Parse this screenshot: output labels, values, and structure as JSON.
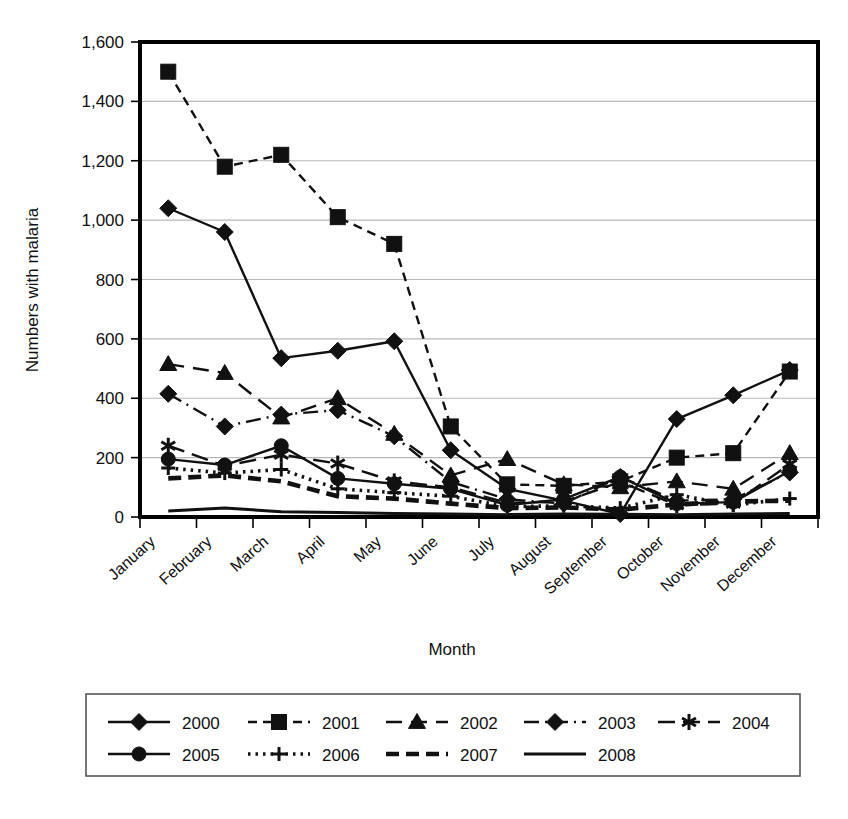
{
  "chart_data": {
    "type": "line",
    "title": "",
    "xlabel": "Month",
    "ylabel": "Numbers with malaria",
    "ylim": [
      0,
      1600
    ],
    "ytick_step": 200,
    "yticks": [
      "0",
      "200",
      "400",
      "600",
      "800",
      "1,000",
      "1,200",
      "1,400",
      "1,600"
    ],
    "grid": "horizontal",
    "legend_position": "bottom",
    "categories": [
      "January",
      "February",
      "March",
      "April",
      "May",
      "June",
      "July",
      "August",
      "September",
      "October",
      "November",
      "December"
    ],
    "series": [
      {
        "name": "2000",
        "marker": "diamond",
        "line": "solid",
        "values": [
          1040,
          960,
          535,
          560,
          592,
          225,
          95,
          55,
          10,
          330,
          410,
          495
        ]
      },
      {
        "name": "2001",
        "marker": "square",
        "line": "dashed",
        "values": [
          1500,
          1180,
          1220,
          1010,
          920,
          305,
          110,
          105,
          120,
          200,
          215,
          490
        ]
      },
      {
        "name": "2002",
        "marker": "triangle",
        "line": "longdash",
        "values": [
          515,
          485,
          335,
          400,
          280,
          140,
          195,
          110,
          100,
          120,
          95,
          215
        ]
      },
      {
        "name": "2003",
        "marker": "diamond",
        "line": "dashdot",
        "values": [
          415,
          305,
          345,
          360,
          272,
          118,
          60,
          45,
          135,
          55,
          60,
          150
        ]
      },
      {
        "name": "2004",
        "marker": "star",
        "line": "longdash2",
        "values": [
          240,
          172,
          210,
          180,
          120,
          100,
          48,
          52,
          118,
          40,
          45,
          178
        ]
      },
      {
        "name": "2005",
        "marker": "circle",
        "line": "solid",
        "values": [
          195,
          175,
          240,
          130,
          112,
          95,
          40,
          60,
          135,
          45,
          50,
          155
        ]
      },
      {
        "name": "2006",
        "marker": "plus",
        "line": "dotted",
        "values": [
          165,
          148,
          160,
          95,
          82,
          70,
          35,
          38,
          30,
          75,
          40,
          62
        ]
      },
      {
        "name": "2007",
        "marker": "none",
        "line": "thickdash",
        "values": [
          130,
          140,
          120,
          70,
          62,
          45,
          30,
          32,
          25,
          42,
          52,
          55
        ]
      },
      {
        "name": "2008",
        "marker": "none",
        "line": "solidthick",
        "values": [
          20,
          30,
          18,
          15,
          12,
          10,
          8,
          10,
          9,
          8,
          10,
          12
        ]
      }
    ]
  },
  "legend": {
    "rows": [
      [
        "2000",
        "2001",
        "2002",
        "2003",
        "2004"
      ],
      [
        "2005",
        "2006",
        "2007",
        "2008"
      ]
    ]
  },
  "colors": {
    "ink": "#111111",
    "grid": "#b8b8b8",
    "axis": "#000000",
    "background": "#ffffff"
  }
}
